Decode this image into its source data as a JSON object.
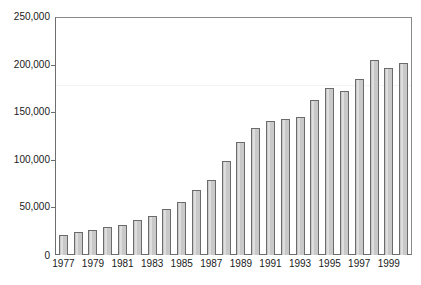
{
  "chart_data": {
    "type": "bar",
    "title": "",
    "subtitle": "",
    "xlabel": "",
    "ylabel": "",
    "ylim": [
      0,
      250000
    ],
    "xlim_categories_count": 24,
    "grid": false,
    "legend": null,
    "y_ticks": [
      0,
      50000,
      100000,
      150000,
      200000,
      250000
    ],
    "y_tick_labels": [
      "0",
      "50,000",
      "100,000",
      "150,000",
      "200,000",
      "250,000"
    ],
    "categories": [
      "1977",
      "1978",
      "1979",
      "1980",
      "1981",
      "1982",
      "1983",
      "1984",
      "1985",
      "1986",
      "1987",
      "1988",
      "1989",
      "1990",
      "1991",
      "1992",
      "1993",
      "1994",
      "1995",
      "1996",
      "1997",
      "1998",
      "1999",
      "2000"
    ],
    "x_tick_labels_shown": [
      "1977",
      "1979",
      "1981",
      "1983",
      "1985",
      "1987",
      "1989",
      "1991",
      "1993",
      "1995",
      "1997",
      "1999"
    ],
    "values": [
      21000,
      24000,
      26000,
      29000,
      32000,
      37000,
      41000,
      48000,
      56000,
      68000,
      79000,
      99000,
      119000,
      133000,
      141000,
      143000,
      145000,
      163000,
      175000,
      172000,
      185000,
      205000,
      196000,
      202000
    ],
    "series": [
      {
        "name": "",
        "values": [
          21000,
          24000,
          26000,
          29000,
          32000,
          37000,
          41000,
          48000,
          56000,
          68000,
          79000,
          99000,
          119000,
          133000,
          141000,
          143000,
          145000,
          163000,
          175000,
          172000,
          185000,
          205000,
          196000,
          202000
        ]
      }
    ],
    "colors": {
      "bar_fill": "#c9c9c9",
      "bar_border": "#6b6b6b",
      "bar_highlight": "#dedede",
      "axis": "#6e6e6e",
      "frame": "#8a8a8a",
      "text": "#1a1a1a",
      "background": "#ffffff"
    }
  }
}
